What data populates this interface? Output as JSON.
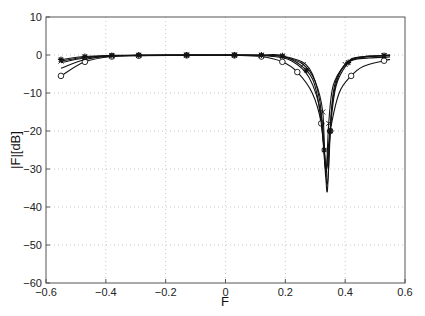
{
  "chart_data": {
    "type": "line",
    "title": "",
    "xlabel": "F",
    "ylabel": "|F|[dB]",
    "xlim": [
      -0.6,
      0.6
    ],
    "ylim": [
      -60,
      10
    ],
    "grid": true,
    "legend": null,
    "xticks": [
      -0.6,
      -0.4,
      -0.2,
      0,
      0.2,
      0.4,
      0.6
    ],
    "xtick_labels": [
      "-0.6",
      "-0.4",
      "-0.2",
      "0",
      "0.2",
      "0.4",
      "0.6"
    ],
    "yticks": [
      10,
      0,
      -10,
      -20,
      -30,
      -40,
      -50,
      -60
    ],
    "ytick_labels": [
      "10",
      "0",
      "-10",
      "-20",
      "-30",
      "-40",
      "-50",
      "-60"
    ],
    "notch": {
      "F": 0.34,
      "depth_db": -36
    },
    "series": [
      {
        "name": "curve-circle",
        "marker": "circle",
        "x": [
          -0.55,
          -0.47,
          -0.38,
          -0.29,
          -0.13,
          0.03,
          0.12,
          0.19,
          0.24,
          0.29,
          0.32,
          0.335,
          0.35,
          0.38,
          0.42,
          0.46,
          0.53,
          0.55
        ],
        "y": [
          -5.5,
          -1.8,
          -0.4,
          -0.2,
          -0.1,
          -0.1,
          -0.4,
          -1.8,
          -4.5,
          -10,
          -18,
          -30,
          -20,
          -10,
          -5.5,
          -3,
          -1.5,
          -1.2
        ]
      },
      {
        "name": "curve-x",
        "marker": "x",
        "x": [
          -0.55,
          -0.47,
          -0.38,
          -0.29,
          -0.13,
          0.03,
          0.12,
          0.19,
          0.26,
          0.3,
          0.325,
          0.335,
          0.345,
          0.36,
          0.4,
          0.44,
          0.53,
          0.55
        ],
        "y": [
          -1.6,
          -0.6,
          -0.2,
          -0.1,
          0,
          0,
          -0.1,
          -0.4,
          -2.5,
          -7,
          -15,
          -32,
          -18,
          -8,
          -2.5,
          -0.8,
          -0.2,
          -0.1
        ]
      },
      {
        "name": "curve-star",
        "marker": "star",
        "x": [
          -0.55,
          -0.47,
          -0.38,
          -0.29,
          -0.13,
          0.03,
          0.12,
          0.19,
          0.27,
          0.305,
          0.33,
          0.34,
          0.35,
          0.37,
          0.41,
          0.44,
          0.53,
          0.55
        ],
        "y": [
          -1.2,
          -0.4,
          -0.1,
          0,
          0,
          0,
          0,
          -0.2,
          -4,
          -10,
          -25,
          -36,
          -20,
          -8,
          -2,
          -0.6,
          -0.1,
          0
        ]
      },
      {
        "name": "curve-plain-1",
        "marker": "none",
        "x": [
          -0.55,
          -0.47,
          -0.38,
          -0.2,
          0.03,
          0.15,
          0.22,
          0.28,
          0.32,
          0.34,
          0.355,
          0.38,
          0.42,
          0.48,
          0.55
        ],
        "y": [
          -3.5,
          -1.2,
          -0.3,
          -0.1,
          0,
          -0.3,
          -1.5,
          -6,
          -16,
          -34,
          -14,
          -5,
          -1.5,
          -0.8,
          -0.5
        ]
      },
      {
        "name": "curve-plain-2",
        "marker": "none",
        "x": [
          -0.55,
          -0.47,
          -0.38,
          -0.2,
          0.03,
          0.15,
          0.22,
          0.28,
          0.315,
          0.338,
          0.36,
          0.39,
          0.43,
          0.48,
          0.55
        ],
        "y": [
          -2,
          -0.8,
          -0.2,
          0,
          0,
          -0.1,
          -0.8,
          -3.5,
          -12,
          -30,
          -10,
          -3.5,
          -1,
          -0.3,
          -0.1
        ]
      }
    ]
  }
}
